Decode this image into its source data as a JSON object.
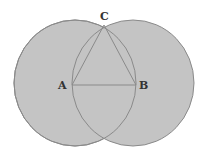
{
  "diagram": {
    "colors": {
      "background": "#ffffff",
      "circle_fill": "#c4c4c4",
      "stroke": "#8a8a8a",
      "label": "#333333"
    },
    "points": {
      "A": {
        "label": "A",
        "x": 72,
        "y": 85
      },
      "B": {
        "label": "B",
        "x": 136,
        "y": 85
      },
      "C": {
        "label": "C",
        "x": 104,
        "y": 25
      }
    },
    "circles": [
      {
        "name": "circle-centered-A",
        "cx": 75,
        "cy": 83,
        "rx": 61,
        "ry": 63
      },
      {
        "name": "circle-centered-B",
        "cx": 133,
        "cy": 83,
        "rx": 61,
        "ry": 63
      }
    ],
    "segments": [
      "AB",
      "AC",
      "BC"
    ]
  }
}
